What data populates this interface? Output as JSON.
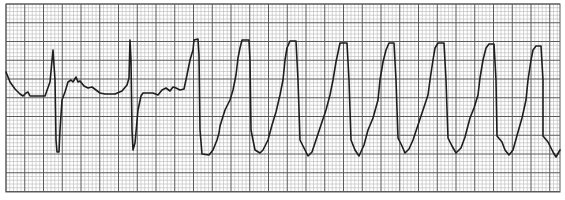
{
  "chart_data": {
    "type": "line",
    "title": "",
    "xlabel": "",
    "ylabel": "",
    "grid": true,
    "legend": "none",
    "grid_box": {
      "x": 6,
      "y": 4,
      "width": 554,
      "height": 188
    },
    "minor_spacing_px": 3.75,
    "major_spacing_px": 18.75,
    "colors": {
      "minor": "#b8b8b8",
      "major": "#5a5a5a",
      "trace": "#1e1e1e",
      "background": "#ffffff"
    },
    "trace_points": [
      [
        6,
        72
      ],
      [
        10,
        82
      ],
      [
        15,
        89
      ],
      [
        20,
        94
      ],
      [
        23,
        96
      ],
      [
        26,
        93
      ],
      [
        28,
        92
      ],
      [
        30,
        96
      ],
      [
        38,
        96
      ],
      [
        45,
        96
      ],
      [
        50,
        82
      ],
      [
        53,
        50
      ],
      [
        55,
        80
      ],
      [
        56,
        140
      ],
      [
        57,
        152
      ],
      [
        59,
        152
      ],
      [
        60,
        130
      ],
      [
        62,
        100
      ],
      [
        65,
        92
      ],
      [
        68,
        82
      ],
      [
        71,
        80
      ],
      [
        73,
        82
      ],
      [
        76,
        77
      ],
      [
        78,
        82
      ],
      [
        80,
        81
      ],
      [
        84,
        86
      ],
      [
        88,
        88
      ],
      [
        92,
        87
      ],
      [
        96,
        90
      ],
      [
        100,
        93
      ],
      [
        105,
        94
      ],
      [
        115,
        94
      ],
      [
        122,
        91
      ],
      [
        127,
        85
      ],
      [
        129,
        78
      ],
      [
        130,
        40
      ],
      [
        131,
        60
      ],
      [
        132,
        130
      ],
      [
        133,
        150
      ],
      [
        135,
        143
      ],
      [
        138,
        110
      ],
      [
        141,
        96
      ],
      [
        143,
        93
      ],
      [
        147,
        93
      ],
      [
        153,
        93
      ],
      [
        158,
        95
      ],
      [
        162,
        90
      ],
      [
        166,
        88
      ],
      [
        170,
        91
      ],
      [
        173,
        87
      ],
      [
        176,
        88
      ],
      [
        180,
        90
      ],
      [
        184,
        89
      ],
      [
        187,
        75
      ],
      [
        190,
        60
      ],
      [
        193,
        50
      ],
      [
        194,
        40
      ],
      [
        198,
        39
      ],
      [
        199,
        55
      ],
      [
        200,
        130
      ],
      [
        202,
        154
      ],
      [
        209,
        155
      ],
      [
        213,
        150
      ],
      [
        217,
        140
      ],
      [
        219,
        133
      ],
      [
        220,
        126
      ],
      [
        225,
        110
      ],
      [
        230,
        100
      ],
      [
        233,
        90
      ],
      [
        236,
        75
      ],
      [
        238,
        58
      ],
      [
        240,
        48
      ],
      [
        242,
        40
      ],
      [
        249,
        40
      ],
      [
        250,
        60
      ],
      [
        251,
        130
      ],
      [
        255,
        150
      ],
      [
        260,
        153
      ],
      [
        263,
        150
      ],
      [
        268,
        140
      ],
      [
        272,
        125
      ],
      [
        276,
        112
      ],
      [
        280,
        95
      ],
      [
        283,
        80
      ],
      [
        285,
        60
      ],
      [
        287,
        48
      ],
      [
        290,
        41
      ],
      [
        296,
        41
      ],
      [
        298,
        80
      ],
      [
        300,
        140
      ],
      [
        305,
        150
      ],
      [
        308,
        156
      ],
      [
        312,
        152
      ],
      [
        316,
        140
      ],
      [
        321,
        125
      ],
      [
        326,
        110
      ],
      [
        330,
        95
      ],
      [
        333,
        80
      ],
      [
        336,
        62
      ],
      [
        340,
        43
      ],
      [
        347,
        43
      ],
      [
        349,
        80
      ],
      [
        351,
        140
      ],
      [
        355,
        150
      ],
      [
        359,
        156
      ],
      [
        364,
        145
      ],
      [
        368,
        130
      ],
      [
        373,
        118
      ],
      [
        378,
        100
      ],
      [
        380,
        80
      ],
      [
        383,
        62
      ],
      [
        386,
        50
      ],
      [
        389,
        43
      ],
      [
        394,
        43
      ],
      [
        396,
        80
      ],
      [
        398,
        138
      ],
      [
        402,
        146
      ],
      [
        405,
        153
      ],
      [
        409,
        149
      ],
      [
        413,
        140
      ],
      [
        418,
        125
      ],
      [
        423,
        110
      ],
      [
        428,
        95
      ],
      [
        430,
        80
      ],
      [
        433,
        60
      ],
      [
        435,
        48
      ],
      [
        438,
        43
      ],
      [
        444,
        43
      ],
      [
        446,
        80
      ],
      [
        448,
        138
      ],
      [
        452,
        146
      ],
      [
        456,
        153
      ],
      [
        461,
        148
      ],
      [
        465,
        137
      ],
      [
        470,
        118
      ],
      [
        474,
        108
      ],
      [
        478,
        95
      ],
      [
        480,
        78
      ],
      [
        483,
        60
      ],
      [
        486,
        48
      ],
      [
        489,
        44
      ],
      [
        494,
        44
      ],
      [
        496,
        80
      ],
      [
        497,
        136
      ],
      [
        502,
        142
      ],
      [
        505,
        150
      ],
      [
        509,
        155
      ],
      [
        513,
        150
      ],
      [
        518,
        132
      ],
      [
        522,
        118
      ],
      [
        526,
        100
      ],
      [
        528,
        80
      ],
      [
        531,
        60
      ],
      [
        533,
        50
      ],
      [
        536,
        46
      ],
      [
        541,
        46
      ],
      [
        543,
        80
      ],
      [
        543,
        136
      ],
      [
        548,
        142
      ],
      [
        553,
        152
      ],
      [
        556,
        157
      ],
      [
        560,
        150
      ]
    ],
    "beats": [
      {
        "type": "sinus",
        "r_peak_x": 53
      },
      {
        "type": "sinus",
        "r_peak_x": 130
      },
      {
        "type": "wide-complex",
        "peak_x": 196
      },
      {
        "type": "wide-complex",
        "peak_x": 245
      },
      {
        "type": "wide-complex",
        "peak_x": 293
      },
      {
        "type": "wide-complex",
        "peak_x": 343
      },
      {
        "type": "wide-complex",
        "peak_x": 391
      },
      {
        "type": "wide-complex",
        "peak_x": 441
      },
      {
        "type": "wide-complex",
        "peak_x": 491
      },
      {
        "type": "wide-complex",
        "peak_x": 538
      }
    ]
  }
}
